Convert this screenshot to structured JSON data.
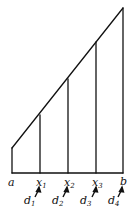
{
  "diagram": {
    "type": "trapezoid-partition",
    "stroke_color": "#111111",
    "background": "#ffffff",
    "baseline_labels": [
      {
        "id": "a",
        "text": "a",
        "sub": ""
      },
      {
        "id": "x1",
        "text": "x",
        "sub": "1"
      },
      {
        "id": "x2",
        "text": "x",
        "sub": "2"
      },
      {
        "id": "x3",
        "text": "x",
        "sub": "3"
      },
      {
        "id": "b",
        "text": "b",
        "sub": ""
      }
    ],
    "interval_labels": [
      {
        "id": "d1",
        "text": "d",
        "sub": "1"
      },
      {
        "id": "d2",
        "text": "d",
        "sub": "2"
      },
      {
        "id": "d3",
        "text": "d",
        "sub": "3"
      },
      {
        "id": "d4",
        "text": "d",
        "sub": "4"
      }
    ],
    "arrow_icon": "up-right-arrow"
  }
}
